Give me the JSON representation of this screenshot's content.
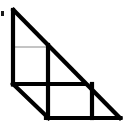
{
  "figure": {
    "type": "geometric-diagram",
    "canvas": {
      "width": 127,
      "height": 133
    },
    "colors": {
      "background": "#ffffff",
      "stroke_heavy": "#000000",
      "stroke_light": "#8a8a8a",
      "mark": "#1a1a1a"
    },
    "stroke_widths": {
      "heavy": 4.2,
      "light": 1.0
    },
    "vertices": {
      "apex": {
        "x": 13,
        "y": 10,
        "label": "top vertex"
      },
      "left_base": {
        "x": 13,
        "y": 118,
        "label": "bottom-left vertex"
      },
      "right_base": {
        "x": 120,
        "y": 118,
        "label": "bottom-right vertex"
      }
    },
    "grid": {
      "cell_width": 35.6,
      "cell_height": 36,
      "columns": 3,
      "rows": 3,
      "x_lines": [
        13,
        48.6,
        84.2,
        120
      ],
      "y_lines": [
        10,
        46,
        82,
        118
      ]
    },
    "heavy_segments": [
      {
        "name": "left-edge",
        "x1": 13,
        "y1": 10,
        "x2": 13,
        "y2": 84
      },
      {
        "name": "hypotenuse",
        "x1": 13,
        "y1": 10,
        "x2": 120,
        "y2": 118
      },
      {
        "name": "bottom-edge",
        "x1": 48,
        "y1": 118,
        "x2": 120,
        "y2": 118
      },
      {
        "name": "lower-left-diagonal",
        "x1": 13,
        "y1": 84,
        "x2": 48,
        "y2": 118
      },
      {
        "name": "center-vertical",
        "x1": 48,
        "y1": 47,
        "x2": 48,
        "y2": 118
      },
      {
        "name": "mid-horizontal",
        "x1": 13,
        "y1": 84,
        "x2": 84,
        "y2": 84
      },
      {
        "name": "right-vertical",
        "x1": 92,
        "y1": 84,
        "x2": 92,
        "y2": 118
      }
    ],
    "light_segments": [
      {
        "name": "upper-horizontal",
        "x1": 13,
        "y1": 47,
        "x2": 50,
        "y2": 47
      },
      {
        "name": "mid-horizontal-thin",
        "x1": 13,
        "y1": 84,
        "x2": 92,
        "y2": 84
      },
      {
        "name": "center-vertical-thin",
        "x1": 48,
        "y1": 47,
        "x2": 48,
        "y2": 118
      }
    ],
    "mark": {
      "name": "left-edge-tick",
      "x": 1,
      "y": 11,
      "width": 3,
      "height": 5
    }
  }
}
